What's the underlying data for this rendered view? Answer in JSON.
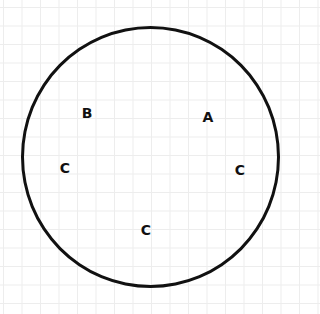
{
  "diagram": {
    "shape": "circle",
    "stroke_color": "#111111",
    "grid_color": "#ededed",
    "labels": [
      {
        "text": "B",
        "x": 87,
        "y": 113
      },
      {
        "text": "A",
        "x": 208,
        "y": 117
      },
      {
        "text": "C",
        "x": 65,
        "y": 168
      },
      {
        "text": "C",
        "x": 240,
        "y": 170
      },
      {
        "text": "C",
        "x": 146,
        "y": 230
      }
    ]
  }
}
